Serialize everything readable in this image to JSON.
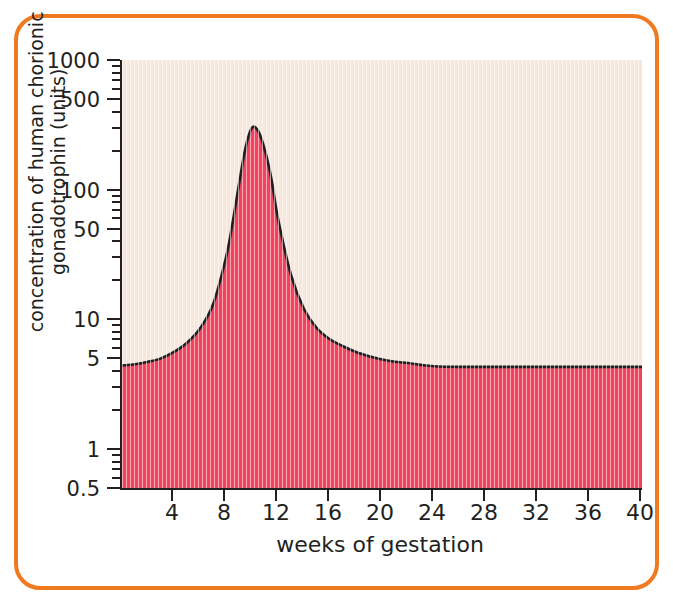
{
  "figure": {
    "border_color": "#f07a20",
    "plot_background": "#f7e6da",
    "fill_color": "#f4415c",
    "line_color": "#231f20",
    "axis_color": "#231f20"
  },
  "chart_data": {
    "type": "area",
    "title": "",
    "xlabel": "weeks of gestation",
    "ylabel": "concentration of human chorionic gonadotrophin (units)",
    "yscale": "log",
    "ylim": [
      0.5,
      1000
    ],
    "xlim": [
      0,
      40
    ],
    "grid": false,
    "legend": null,
    "ytick_labels": [
      "1000",
      "500",
      "100",
      "50",
      "10",
      "5",
      "1",
      "0.5"
    ],
    "ytick_values": [
      1000,
      500,
      100,
      50,
      10,
      5,
      1,
      0.5
    ],
    "yminor_values": [
      900,
      800,
      700,
      600,
      400,
      300,
      200,
      90,
      80,
      70,
      60,
      40,
      30,
      20,
      9,
      8,
      7,
      6,
      4,
      3,
      2,
      0.9,
      0.8,
      0.7,
      0.6
    ],
    "xtick_labels": [
      "4",
      "8",
      "12",
      "16",
      "20",
      "24",
      "28",
      "32",
      "36",
      "40"
    ],
    "xtick_values": [
      4,
      8,
      12,
      16,
      20,
      24,
      28,
      32,
      36,
      40
    ],
    "series": [
      {
        "name": "human chorionic gonadotrophin",
        "x": [
          0,
          1,
          2,
          3,
          4,
          5,
          6,
          7,
          8,
          8.5,
          9,
          9.5,
          10,
          10.5,
          11,
          11.5,
          12,
          13,
          14,
          15,
          16,
          17,
          18,
          19,
          20,
          21,
          22,
          23,
          24,
          26,
          28,
          30,
          32,
          34,
          36,
          38,
          40
        ],
        "y": [
          4.4,
          4.5,
          4.7,
          5.0,
          5.6,
          6.6,
          8.5,
          13,
          30,
          55,
          110,
          210,
          300,
          280,
          200,
          120,
          60,
          22,
          12,
          8.5,
          7.0,
          6.2,
          5.6,
          5.2,
          4.9,
          4.7,
          4.6,
          4.45,
          4.35,
          4.3,
          4.3,
          4.3,
          4.3,
          4.3,
          4.3,
          4.3,
          4.3
        ]
      }
    ]
  }
}
